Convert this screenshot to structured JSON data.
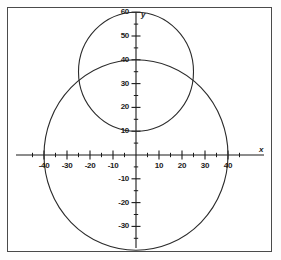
{
  "chart_data": {
    "type": "line",
    "title": "",
    "xlabel": "x",
    "ylabel": "y",
    "xlim": [
      -46,
      48
    ],
    "ylim": [
      -42,
      62
    ],
    "grid": false,
    "legend": "none",
    "x_tick_labels": [
      "-40",
      "-30",
      "-20",
      "-10",
      "10",
      "20",
      "30",
      "40"
    ],
    "x_tick_values": [
      -40,
      -30,
      -20,
      -10,
      10,
      20,
      30,
      40
    ],
    "x_minor_step": 5,
    "y_tick_labels": [
      "60",
      "50",
      "40",
      "30",
      "20",
      "10",
      "-10",
      "-20",
      "-30"
    ],
    "y_tick_values": [
      60,
      50,
      40,
      30,
      20,
      10,
      -10,
      -20,
      -30
    ],
    "y_minor_step": 5,
    "series": [
      {
        "name": "large-circle",
        "shape": "circle",
        "center": [
          0,
          0
        ],
        "radius": 40,
        "color": "#2b2b2b"
      },
      {
        "name": "small-circle",
        "shape": "circle",
        "center": [
          0,
          35
        ],
        "radius": 25,
        "color": "#2b2b2b"
      }
    ],
    "annotations": []
  },
  "axes": {
    "x_axis_label": "x",
    "y_axis_label": "y"
  }
}
